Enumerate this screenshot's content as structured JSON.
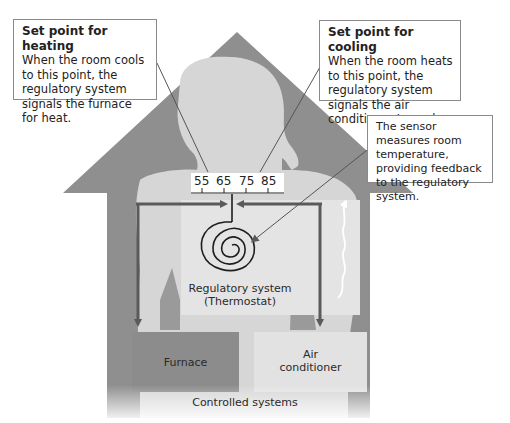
{
  "diagram": {
    "colors": {
      "house": "#8f8f8f",
      "person": "#d6d6d6",
      "thermostat_panel": "#e4e4e4",
      "furnace": "#8c8c8c",
      "air_conditioner": "#e2e2e2",
      "arrow": "#5a5a5a",
      "coil": "#1e1e1e"
    },
    "callouts": {
      "heating": {
        "title": "Set point for heating",
        "body": "When the room cools to this point, the regulatory system signals the furnace for heat."
      },
      "cooling": {
        "title": "Set point for cooling",
        "body": "When the room heats to this point, the regulatory system signals the air conditioner to cool."
      },
      "sensor": {
        "body": "The sensor measures room temperature, providing feedback to the regulatory system."
      }
    },
    "scale": {
      "values": [
        "55",
        "65",
        "75",
        "85"
      ]
    },
    "regulatory_system": {
      "line1": "Regulatory system",
      "line2": "(Thermostat)"
    },
    "controlled_systems": {
      "label": "Controlled systems",
      "furnace": "Furnace",
      "air_conditioner_line1": "Air",
      "air_conditioner_line2": "conditioner"
    },
    "icons": {
      "coil": "spiral-sensor-icon",
      "heat_wave": "wavy-up-arrow-icon"
    }
  }
}
